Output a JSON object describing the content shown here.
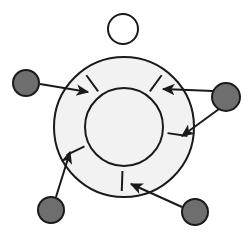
{
  "figure": {
    "type": "schematic-diagram",
    "width": 249,
    "height": 239,
    "background_color": "#ffffff",
    "stroke_color": "#1a1a1a",
    "caption": ""
  },
  "colors": {
    "outline": "#1a1a1a",
    "ring_fill": "#f2f2f2",
    "inner_disc_fill": "#f2f2f2",
    "marker_fill": "#6e6e6e",
    "marker_outline": "#1a1a1a",
    "key_circle_fill": "#ffffff",
    "arrow_color": "#1a1a1a"
  },
  "annulus": {
    "label": "annulus",
    "center": {
      "x": 124,
      "y": 127
    },
    "outer_radius": 70,
    "inner_radius": 39,
    "outer_stroke_width": 2.0,
    "inner_stroke_width": 2.0
  },
  "key_circle": {
    "label": "unfilled reference circle",
    "center": {
      "x": 123,
      "y": 29
    },
    "radius": 15,
    "stroke_width": 2.0,
    "fill": "#ffffff"
  },
  "tick_marks": [
    {
      "name": "tick-upper-left",
      "angle_deg": 126,
      "r_inner": 44,
      "r_outer": 64,
      "stroke_width": 2.0
    },
    {
      "name": "tick-upper-right",
      "angle_deg": 54,
      "r_inner": 44,
      "r_outer": 64,
      "stroke_width": 2.0
    },
    {
      "name": "tick-right",
      "angle_deg": -8,
      "r_inner": 44,
      "r_outer": 64,
      "stroke_width": 2.0
    },
    {
      "name": "tick-lower-left",
      "angle_deg": 206,
      "r_inner": 44,
      "r_outer": 64,
      "stroke_width": 2.0
    },
    {
      "name": "tick-bottom",
      "angle_deg": 268,
      "r_inner": 44,
      "r_outer": 64,
      "stroke_width": 2.0
    }
  ],
  "markers": [
    {
      "name": "marker-left",
      "center": {
        "x": 26,
        "y": 83
      },
      "radius": 13,
      "arrows": [
        {
          "name": "arrow-left-to-upper-left-tick",
          "from": {
            "x": 40,
            "y": 84
          },
          "to": {
            "x": 88,
            "y": 92
          }
        }
      ]
    },
    {
      "name": "marker-right",
      "center": {
        "x": 226,
        "y": 97
      },
      "radius": 14,
      "arrows": [
        {
          "name": "arrow-right-to-upper-right-tick",
          "from": {
            "x": 213,
            "y": 91
          },
          "to": {
            "x": 163,
            "y": 89
          }
        },
        {
          "name": "arrow-right-to-right-tick",
          "from": {
            "x": 219,
            "y": 109
          },
          "to": {
            "x": 182,
            "y": 136
          }
        }
      ]
    },
    {
      "name": "marker-bottom-left",
      "center": {
        "x": 51,
        "y": 210
      },
      "radius": 13,
      "arrows": [
        {
          "name": "arrow-bottom-left-to-lower-left-tick",
          "from": {
            "x": 56,
            "y": 197
          },
          "to": {
            "x": 70,
            "y": 152
          }
        }
      ]
    },
    {
      "name": "marker-bottom-right",
      "center": {
        "x": 195,
        "y": 212
      },
      "radius": 13,
      "arrows": [
        {
          "name": "arrow-bottom-right-to-bottom-tick",
          "from": {
            "x": 182,
            "y": 207
          },
          "to": {
            "x": 131,
            "y": 184
          }
        }
      ]
    }
  ],
  "counts": {
    "markers": 4,
    "arrows": 5,
    "tick_marks": 5,
    "circles": 3
  }
}
